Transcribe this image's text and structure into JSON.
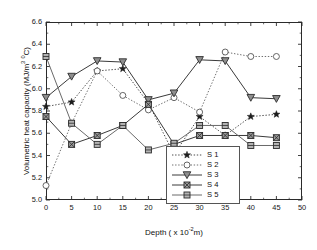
{
  "chart_data": {
    "type": "line",
    "title": "",
    "xlabel": "Depth ( x 10-2m)",
    "xlabel_main": "Depth ( x 10",
    "xlabel_exp": "-2",
    "xlabel_tail": "m)",
    "ylabel": "Volumetric heat capacity (MJ/m3 0C)",
    "ylabel_pre": "Volumetric heat capacity (MJ/m",
    "ylabel_sup1": "3",
    "ylabel_mid": " ",
    "ylabel_sup2": "0",
    "ylabel_post": "C)",
    "xlim": [
      0,
      50
    ],
    "ylim": [
      5.0,
      6.6
    ],
    "xticks": [
      0,
      5,
      10,
      15,
      20,
      25,
      30,
      35,
      40,
      45,
      50
    ],
    "yticks": [
      5.0,
      5.2,
      5.4,
      5.6,
      5.8,
      6.0,
      6.2,
      6.4,
      6.6
    ],
    "ytick_labels": [
      "5.0",
      "5.2",
      "5.4",
      "5.6",
      "5.8",
      "6.0",
      "6.2",
      "6.4",
      "6.6"
    ],
    "xtick_labels": [
      "0",
      "5",
      "10",
      "15",
      "20",
      "25",
      "30",
      "35",
      "40",
      "45",
      "50"
    ],
    "grid": false,
    "legend_position": "lower-right-inside",
    "x": [
      0,
      5,
      10,
      15,
      20,
      25,
      30,
      35,
      40,
      45
    ],
    "series": [
      {
        "name": "S 1",
        "marker": "filled-star",
        "linestyle": "dotted",
        "color": "#2b2b2b",
        "values": [
          5.84,
          5.88,
          6.16,
          6.18,
          5.87,
          5.41,
          5.75,
          5.58,
          5.75,
          5.77
        ]
      },
      {
        "name": "S 2",
        "marker": "open-circle",
        "linestyle": "dotted",
        "color": "#555555",
        "values": [
          5.13,
          5.69,
          6.16,
          5.94,
          5.81,
          5.92,
          5.79,
          6.33,
          6.29,
          6.29
        ]
      },
      {
        "name": "S 3",
        "marker": "filled-down-triangle",
        "linestyle": "solid",
        "color": "#3a3a3a",
        "values": [
          5.92,
          6.11,
          6.25,
          6.24,
          5.9,
          5.96,
          6.26,
          6.25,
          5.92,
          5.91
        ]
      },
      {
        "name": "S 4",
        "marker": "crossed-square",
        "linestyle": "solid",
        "color": "#3a3a3a",
        "values": [
          5.75,
          5.5,
          5.58,
          5.67,
          5.86,
          5.5,
          5.58,
          5.58,
          5.58,
          5.56
        ]
      },
      {
        "name": "S 5",
        "marker": "barred-square",
        "linestyle": "solid",
        "color": "#6a6a6a",
        "values": [
          6.29,
          5.69,
          5.5,
          5.67,
          5.45,
          5.51,
          5.67,
          5.67,
          5.49,
          5.49
        ]
      }
    ]
  },
  "legend": {
    "items": [
      {
        "label": "S 1"
      },
      {
        "label": "S 2"
      },
      {
        "label": "S 3"
      },
      {
        "label": "S 4"
      },
      {
        "label": "S 5"
      }
    ]
  }
}
